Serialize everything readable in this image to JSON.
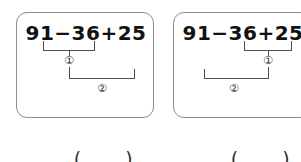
{
  "worksheet": {
    "problems": [
      {
        "id": "problem-left",
        "expression": "91−36+25",
        "steps": [
          {
            "marker": "①",
            "operation": "91−36",
            "order": 1
          },
          {
            "marker": "②",
            "operation": "+25",
            "order": 2
          }
        ],
        "answer_value": "",
        "answer_open": "(",
        "answer_close": ")"
      },
      {
        "id": "problem-right",
        "expression": "91−36+25",
        "steps": [
          {
            "marker": "①",
            "operation": "36+25",
            "order": 1
          },
          {
            "marker": "②",
            "operation": "91−",
            "order": 2
          }
        ],
        "answer_value": "",
        "answer_open": "(",
        "answer_close": ")"
      }
    ]
  },
  "colors": {
    "card_border": "#8a8f92",
    "bracket_line": "#4a4f52",
    "text": "#121212",
    "background": "#ffffff"
  }
}
